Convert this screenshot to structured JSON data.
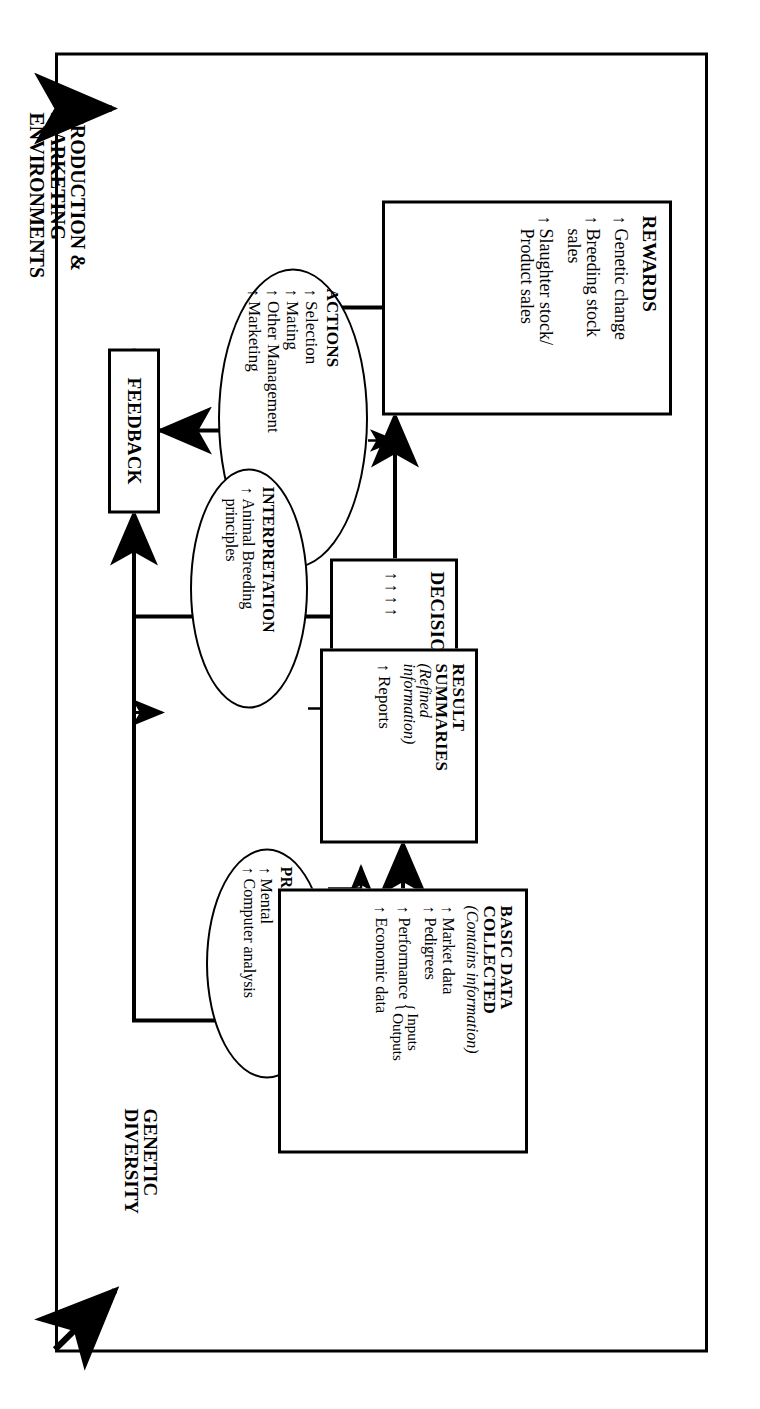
{
  "diagram": {
    "orientation": "rotated-90-clockwise",
    "outside_labels": {
      "production_marketing": "PRODUCTION &\nMARKETING\nENVIRONMENTS",
      "genetic_diversity": "GENETIC\nDIVERSITY"
    },
    "nodes": {
      "basic_data": {
        "shape": "box",
        "title": "BASIC DATA\nCOLLECTED",
        "subtitle": "(Contains information)",
        "bullets": [
          {
            "arrow": "↑",
            "text": "Market data"
          },
          {
            "arrow": "↑",
            "text": "Pedigrees"
          },
          {
            "arrow": "↑",
            "text": "Performance",
            "brace": [
              "Inputs",
              "Outputs"
            ]
          },
          {
            "arrow": "↑",
            "text": "Economic data"
          }
        ]
      },
      "processing": {
        "shape": "ellipse",
        "title": "PROCESSING",
        "bullets": [
          {
            "arrow": "↑",
            "text": "Mental"
          },
          {
            "arrow": "↑",
            "text": "Computer analysis"
          }
        ]
      },
      "result_summaries": {
        "shape": "box",
        "title": "RESULT\nSUMMARIES",
        "subtitle": "(Refined\ninformation)",
        "bullets": [
          {
            "arrow": "↑",
            "text": "Reports"
          }
        ]
      },
      "interpretation": {
        "shape": "ellipse",
        "title": "INTERPRETATION",
        "bullets": [
          {
            "arrow": "↑",
            "text": "Animal Breeding\nprinciples"
          }
        ]
      },
      "decisions": {
        "shape": "box",
        "title": "DECISIONS",
        "arrows": "↑↑↑↑"
      },
      "actions": {
        "shape": "ellipse",
        "title": "ACTIONS",
        "bullets": [
          {
            "arrow": "↑",
            "text": "Selection"
          },
          {
            "arrow": "↑",
            "text": "Mating"
          },
          {
            "arrow": "↑",
            "text": "Other Management"
          },
          {
            "arrow": "↑",
            "text": "Marketing"
          }
        ]
      },
      "rewards": {
        "shape": "box",
        "title": "REWARDS",
        "bullets": [
          {
            "arrow": "↑",
            "text": "Genetic change"
          },
          {
            "arrow": "↑",
            "text": "Breeding stock\nsales"
          },
          {
            "arrow": "↑",
            "text": "Slaughter stock/\nProduct sales"
          }
        ]
      },
      "feedback": {
        "shape": "box",
        "title": "FEEDBACK"
      }
    },
    "colors": {
      "line": "#000000",
      "background": "#ffffff"
    }
  }
}
